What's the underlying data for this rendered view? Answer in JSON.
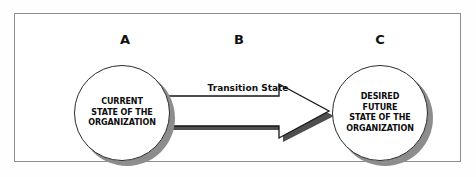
{
  "diagram": {
    "title_visible": false,
    "frame": {
      "border_color": "#8e8e8e",
      "background": "#ffffff"
    },
    "phase_labels": [
      {
        "id": "a",
        "label": "A"
      },
      {
        "id": "b",
        "label": "B"
      },
      {
        "id": "c",
        "label": "C"
      }
    ],
    "nodes": [
      {
        "id": "current-state",
        "phase": "A",
        "shape": "circle",
        "lines": [
          "CURRENT",
          "STATE OF THE",
          "ORGANIZATION"
        ],
        "line1": "CURRENT",
        "line2": "STATE OF THE",
        "line3": "ORGANIZATION",
        "fill": "#ffffff",
        "outline": "#2b2b2b",
        "shadow": "#8d8d8d"
      },
      {
        "id": "desired-future-state",
        "phase": "C",
        "shape": "circle",
        "lines": [
          "DESIRED",
          "FUTURE",
          "STATE OF THE",
          "ORGANIZATION"
        ],
        "line1": "DESIRED",
        "line2": "FUTURE",
        "line3": "STATE OF THE",
        "line4": "ORGANIZATION",
        "fill": "#ffffff",
        "outline": "#2b2b2b",
        "shadow": "#8d8d8d"
      }
    ],
    "connector": {
      "id": "transition-arrow",
      "type": "block-arrow",
      "direction": "left-to-right",
      "label": "Transition State",
      "from": "current-state",
      "to": "desired-future-state",
      "fill": "#ffffff",
      "outline": "#151515",
      "shadow": "#4f4f4f"
    }
  }
}
